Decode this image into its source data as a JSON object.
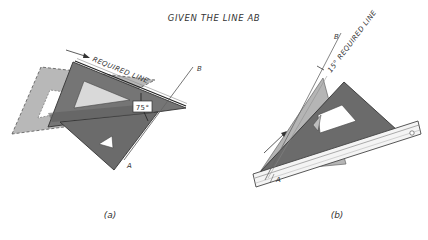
{
  "title": "GIVEN THE LINE AB",
  "figure_a": {
    "caption": "(a)",
    "required_line_label": "REQUIRED LINE",
    "angle_label": "75°",
    "point_a": "A",
    "point_b": "B"
  },
  "figure_b": {
    "caption": "(b)",
    "required_line_label": "15° REQUIRED LINE",
    "point_a": "A",
    "point_b": "B"
  },
  "colors": {
    "dark_triangle": "#6b6b6b",
    "light_triangle": "#b5b5b5",
    "ink": "#333333",
    "background": "#ffffff"
  }
}
